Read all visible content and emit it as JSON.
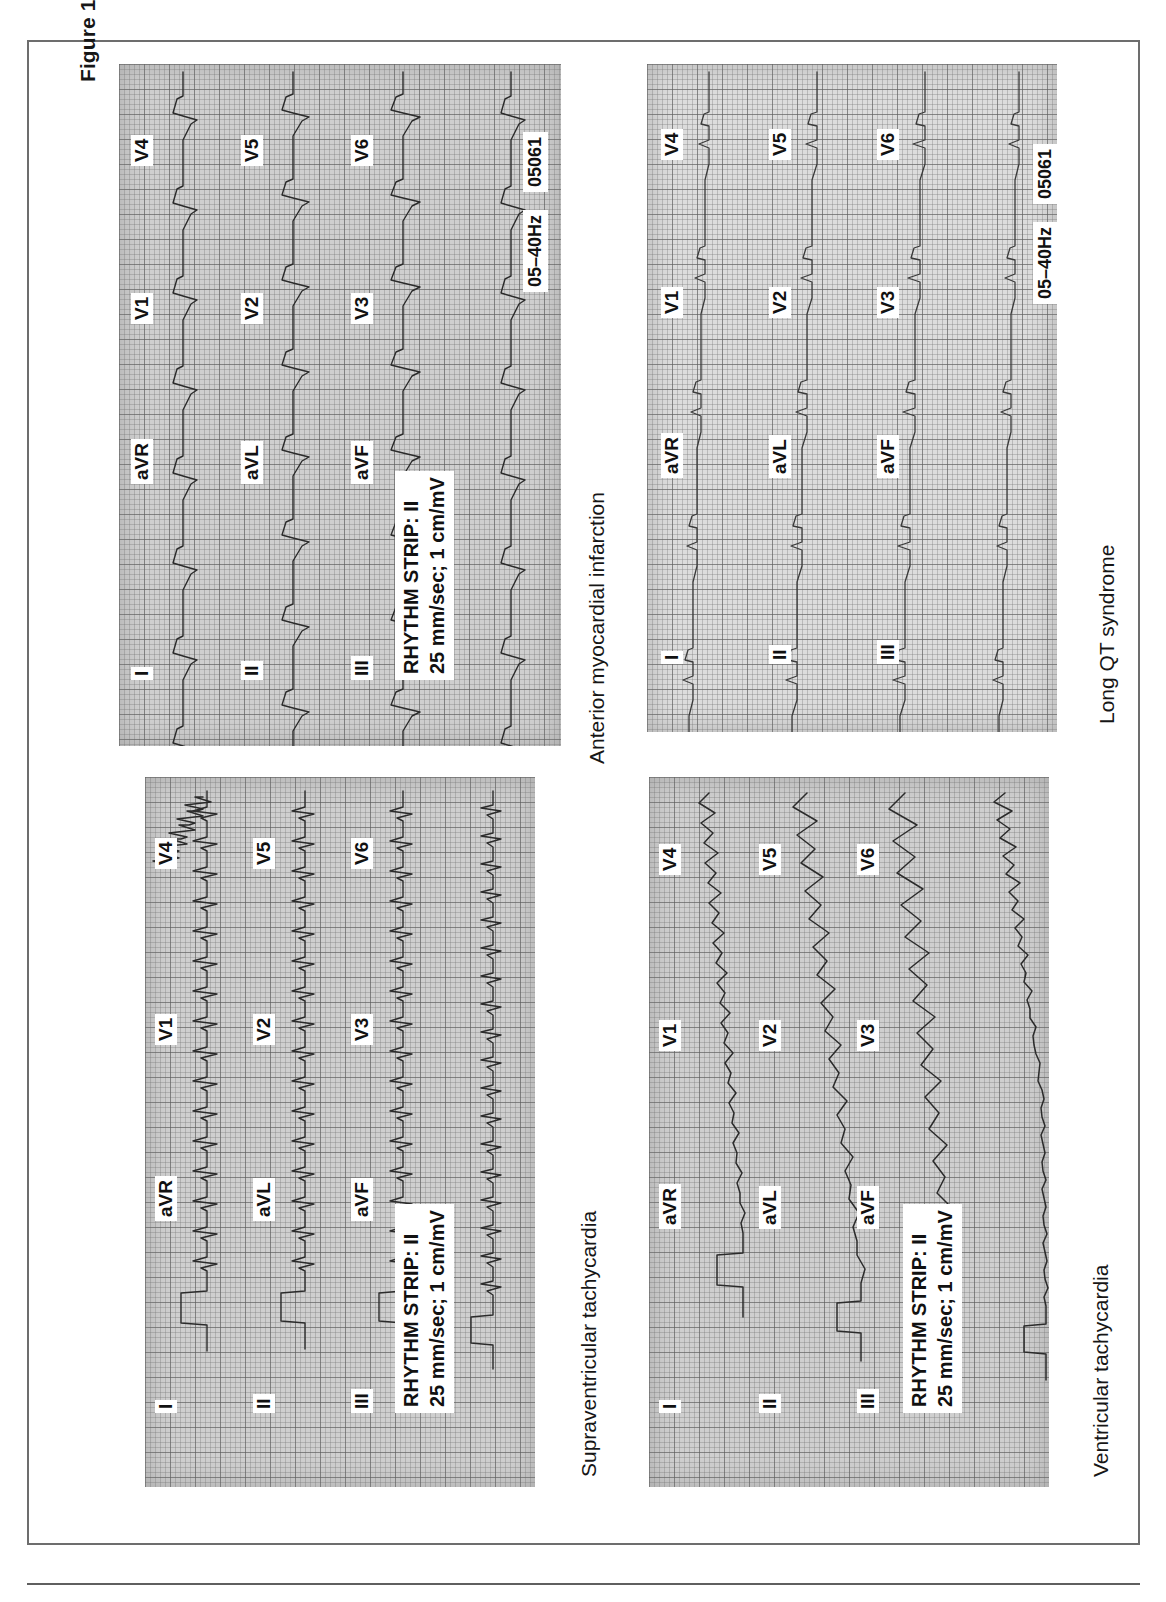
{
  "figure": {
    "number": "Figure 1.1",
    "caption": "ECG strips demonstrating typical changes in common disease states"
  },
  "common": {
    "lead_labels": [
      "I",
      "aVR",
      "V1",
      "V4",
      "II",
      "aVL",
      "V2",
      "V5",
      "III",
      "aVF",
      "V3",
      "V6"
    ],
    "rhythm_line1": "RHYTHM STRIP: II",
    "rhythm_line2": "25 mm/sec; 1 cm/mV",
    "filter_tag": "05–40Hz",
    "id_tag": "05061"
  },
  "panels": [
    {
      "id": "supraventricular-tachycardia",
      "title": "Supraventricular tachycardia",
      "position": "top-left",
      "has_rhythm_box": true,
      "has_meta_tags": false,
      "leads": {
        "row1": [
          "I",
          "aVR",
          "V1",
          "V4"
        ],
        "row2": [
          "II",
          "aVL",
          "V2",
          "V5"
        ],
        "row3": [
          "III",
          "aVF",
          "V3",
          "V6"
        ]
      }
    },
    {
      "id": "anterior-myocardial-infarction",
      "title": "Anterior myocardial infarction",
      "position": "top-right",
      "has_rhythm_box": true,
      "has_meta_tags": true,
      "leads": {
        "row1": [
          "I",
          "aVR",
          "V1",
          "V4"
        ],
        "row2": [
          "II",
          "aVL",
          "V2",
          "V5"
        ],
        "row3": [
          "III",
          "aVF",
          "V3",
          "V6"
        ]
      }
    },
    {
      "id": "ventricular-tachycardia",
      "title": "Ventricular tachycardia",
      "position": "bottom-left",
      "has_rhythm_box": true,
      "has_meta_tags": false,
      "leads": {
        "row1": [
          "I",
          "aVR",
          "V1",
          "V4"
        ],
        "row2": [
          "II",
          "aVL",
          "V2",
          "V5"
        ],
        "row3": [
          "III",
          "aVF",
          "V3",
          "V6"
        ]
      }
    },
    {
      "id": "long-qt-syndrome",
      "title": "Long QT syndrome",
      "position": "bottom-right",
      "has_rhythm_box": false,
      "has_meta_tags": true,
      "leads": {
        "row1": [
          "I",
          "aVR",
          "V1",
          "V4"
        ],
        "row2": [
          "II",
          "aVL",
          "V2",
          "V5"
        ],
        "row3": [
          "III",
          "aVF",
          "V3",
          "V6"
        ]
      }
    }
  ],
  "colors": {
    "frame": "#6d6d6d",
    "grid_paper": "#cfcfcf",
    "trace": "#2b2b2b",
    "text": "#161616"
  }
}
